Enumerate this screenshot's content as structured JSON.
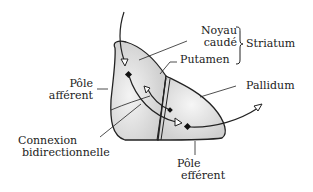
{
  "labels": {
    "noyau_caude_1": "Noyau",
    "noyau_caude_2": "caudé",
    "putamen": "Putamen",
    "striatum": "Striatum",
    "pallidum": "Pallidum",
    "pole_afferent_1": "Pôle",
    "pole_afferent_2": "afférent",
    "connexion_1": "Connexion",
    "connexion_2": "bidirectionnelle",
    "pole_efferent_1": "Pôle",
    "pole_efferent_2": "efférent"
  },
  "colors": {
    "line": "#222222",
    "fill": "#d8d8d8",
    "fill_light": "#eeeeee"
  }
}
